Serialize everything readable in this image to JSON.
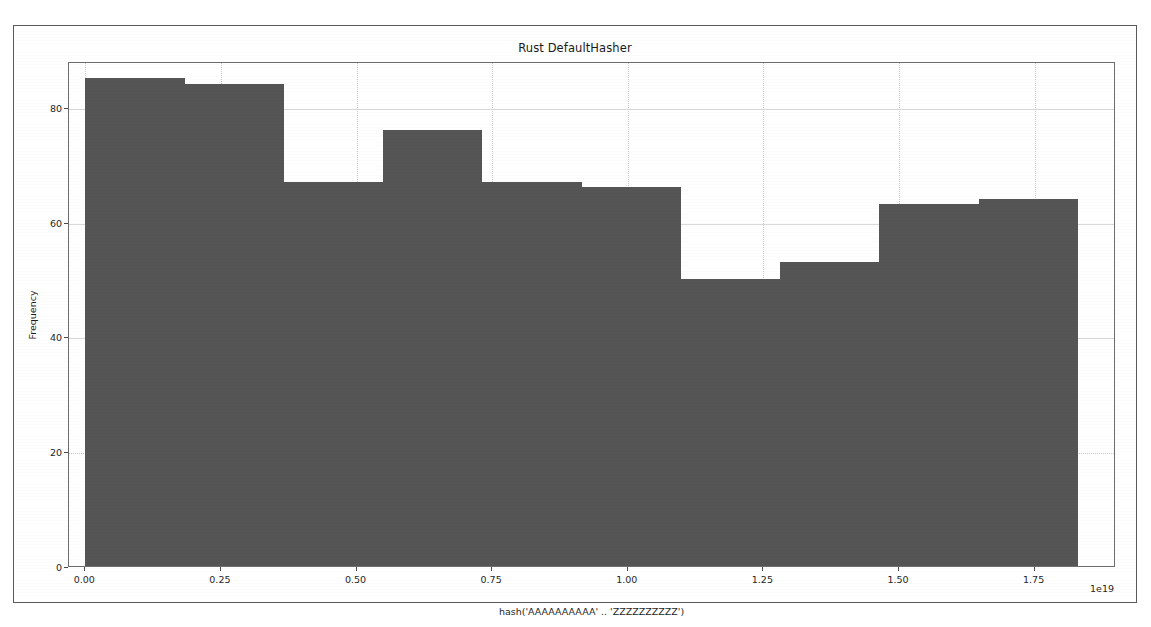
{
  "figure": {
    "title": "Rust DefaultHasher",
    "background_color": "#ffffff",
    "frame_color": "#5a5a5a"
  },
  "chart_data": {
    "type": "bar",
    "title": "Rust DefaultHasher",
    "xlabel": "hash('AAAAAAAAAA' .. 'ZZZZZZZZZZ')",
    "ylabel": "Frequency",
    "x_exponent_label": "1e19",
    "bar_color": "#555555",
    "grid": true,
    "legend": "none",
    "xlim": [
      -3e+17,
      1.9e+19
    ],
    "ylim": [
      0,
      88
    ],
    "xticks": [
      0.0,
      0.25,
      0.5,
      0.75,
      1.0,
      1.25,
      1.5,
      1.75
    ],
    "xtick_labels": [
      "0.00",
      "0.25",
      "0.50",
      "0.75",
      "1.00",
      "1.25",
      "1.50",
      "1.75"
    ],
    "yticks": [
      0,
      20,
      40,
      60,
      80
    ],
    "ytick_labels": [
      "0",
      "20",
      "40",
      "60",
      "80"
    ],
    "bin_edges_1e19": [
      0.0,
      0.183,
      0.366,
      0.549,
      0.732,
      0.915,
      1.098,
      1.281,
      1.464,
      1.647,
      1.83
    ],
    "categories": [
      "0.00-0.18",
      "0.18-0.37",
      "0.37-0.55",
      "0.55-0.73",
      "0.73-0.92",
      "0.92-1.10",
      "1.10-1.28",
      "1.28-1.46",
      "1.46-1.65",
      "1.65-1.83"
    ],
    "values": [
      85,
      84,
      67,
      76,
      67,
      66,
      50,
      53,
      63,
      64
    ]
  }
}
